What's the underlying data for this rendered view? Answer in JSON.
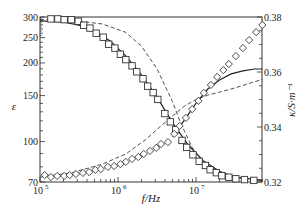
{
  "chart_data": {
    "type": "scatter",
    "title": "",
    "xlabel": "f/Hz",
    "ylabel_left": "ε",
    "ylabel_right": "κ/S·m⁻¹",
    "x_scale": "log",
    "left_scale": "log",
    "right_scale": "linear",
    "xlim": [
      100000,
      70000000
    ],
    "ylim_left": [
      70,
      300
    ],
    "ylim_right": [
      0.32,
      0.38
    ],
    "x_ticks": [
      {
        "value": 100000,
        "label": "10",
        "exp": "5"
      },
      {
        "value": 1000000,
        "label": "10",
        "exp": "6"
      },
      {
        "value": 10000000,
        "label": "10",
        "exp": "7"
      }
    ],
    "left_ticks": [
      {
        "value": 70,
        "label": "70"
      },
      {
        "value": 100,
        "label": "100"
      },
      {
        "value": 150,
        "label": "150"
      },
      {
        "value": 200,
        "label": "200"
      },
      {
        "value": 250,
        "label": "250"
      },
      {
        "value": 300,
        "label": "300"
      }
    ],
    "right_ticks": [
      {
        "value": 0.32,
        "label": "0.32"
      },
      {
        "value": 0.34,
        "label": "0.34"
      },
      {
        "value": 0.36,
        "label": "0.36"
      },
      {
        "value": 0.38,
        "label": "0.38"
      }
    ],
    "series": [
      {
        "name": "ε measured",
        "axis": "left",
        "marker": "square",
        "log_f": [
          5.14,
          5.23,
          5.31,
          5.4,
          5.49,
          5.56,
          5.64,
          5.72,
          5.81,
          5.88,
          5.96,
          6.03,
          6.1,
          6.18,
          6.24,
          6.32,
          6.38,
          6.45,
          6.51,
          6.6,
          6.67,
          6.74,
          6.82,
          6.88,
          6.96,
          7.04,
          7.12,
          7.18,
          7.26,
          7.33,
          7.42,
          7.51,
          7.62,
          7.74
        ],
        "values": [
          295,
          295,
          293,
          293,
          289,
          279,
          272,
          260,
          251,
          236,
          228,
          216,
          206,
          195,
          185,
          174,
          163,
          154,
          145,
          128,
          119,
          111,
          101,
          95,
          89,
          84,
          81,
          78,
          76,
          74,
          73,
          72,
          71.5,
          71
        ]
      },
      {
        "name": "κ measured",
        "axis": "right",
        "marker": "diamond",
        "log_f": [
          5.06,
          5.14,
          5.22,
          5.31,
          5.38,
          5.46,
          5.55,
          5.63,
          5.71,
          5.78,
          5.87,
          5.95,
          6.03,
          6.1,
          6.18,
          6.26,
          6.33,
          6.41,
          6.49,
          6.55,
          6.64,
          6.72,
          6.79,
          6.87,
          6.95,
          7.03,
          7.1,
          7.19,
          7.27,
          7.35,
          7.42,
          7.51,
          7.6,
          7.68,
          7.77,
          7.85
        ],
        "values": [
          0.3225,
          0.3218,
          0.3222,
          0.3222,
          0.3225,
          0.3229,
          0.3233,
          0.3236,
          0.3244,
          0.3247,
          0.3255,
          0.3258,
          0.3265,
          0.3273,
          0.3284,
          0.3291,
          0.3302,
          0.3313,
          0.3324,
          0.3338,
          0.3345,
          0.3375,
          0.3404,
          0.3433,
          0.3465,
          0.3495,
          0.3524,
          0.3553,
          0.3582,
          0.3607,
          0.3629,
          0.3658,
          0.3687,
          0.3716,
          0.3745,
          0.3771
        ]
      },
      {
        "name": "ε model (solid)",
        "axis": "left",
        "style": "solid",
        "log_f": [
          5.0,
          5.3,
          5.6,
          5.9,
          6.1,
          6.3,
          6.5,
          6.7,
          6.9,
          7.1,
          7.3,
          7.5,
          7.85
        ],
        "values": [
          290,
          287,
          275,
          243,
          213,
          180,
          148,
          118,
          97,
          84,
          77,
          73,
          71
        ]
      },
      {
        "name": "ε model (dashed)",
        "axis": "left",
        "style": "dashed",
        "log_f": [
          5.0,
          5.4,
          5.8,
          6.1,
          6.3,
          6.5,
          6.7,
          6.8,
          6.95,
          7.1,
          7.3,
          7.5,
          7.85
        ],
        "values": [
          294,
          292,
          282,
          262,
          232,
          190,
          142,
          118,
          95,
          82,
          76,
          73,
          71
        ]
      },
      {
        "name": "κ model (solid)",
        "axis": "right",
        "style": "solid",
        "log_f": [
          6.7,
          6.85,
          7.0,
          7.15,
          7.3,
          7.45,
          7.6,
          7.75,
          7.85
        ],
        "values": [
          0.3364,
          0.3425,
          0.3487,
          0.3538,
          0.3571,
          0.3593,
          0.3604,
          0.3611,
          0.3611
        ]
      },
      {
        "name": "κ model (dashed)",
        "axis": "right",
        "style": "dashed",
        "log_f": [
          5.0,
          5.4,
          5.8,
          6.1,
          6.35,
          6.55,
          6.7,
          6.85,
          7.0,
          7.15,
          7.3,
          7.5,
          7.7,
          7.85
        ],
        "values": [
          0.3218,
          0.3233,
          0.3265,
          0.3302,
          0.3353,
          0.3404,
          0.344,
          0.3476,
          0.35,
          0.3516,
          0.3527,
          0.3542,
          0.356,
          0.3573
        ]
      }
    ],
    "grid": false,
    "legend": null
  },
  "colors": {
    "axis": "#333333",
    "line": "#222222",
    "marker_stroke": "#333333",
    "background": "#ffffff"
  }
}
